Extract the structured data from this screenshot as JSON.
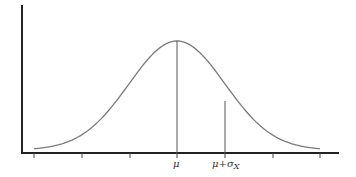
{
  "chart_data": {
    "type": "line",
    "title": "",
    "xlabel": "",
    "ylabel": "",
    "x_tick_labels": [
      {
        "position": "mu",
        "label": "μ"
      },
      {
        "position": "mu+sigma",
        "label": "μ+σ",
        "subscript": "X"
      }
    ],
    "tick_count": 7,
    "grid": false,
    "legend": null,
    "series": [
      {
        "name": "normal-density",
        "shape": "bell-curve",
        "mean_index": 3,
        "sd_ticks": 1
      }
    ],
    "markers": [
      {
        "name": "mean-line",
        "at": "μ"
      },
      {
        "name": "sigma-line",
        "at": "μ+σX"
      }
    ],
    "colors": {
      "curve": "#777777",
      "axis": "#222222",
      "marker_lines": "#555555"
    }
  },
  "labels": {
    "mu": "μ",
    "mu_plus": "μ+σ",
    "sigma_sub": "X"
  }
}
